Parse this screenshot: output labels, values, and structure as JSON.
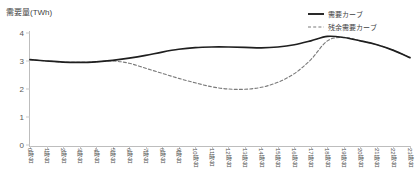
{
  "chart_data": {
    "type": "line",
    "title": "",
    "ylabel": "需要量(TWh)",
    "xlabel": "",
    "ylim": [
      0,
      4
    ],
    "yticks": [
      0,
      1,
      2,
      3,
      4
    ],
    "ytick_labels": [
      "0",
      "1",
      "2",
      "3",
      "4"
    ],
    "grid": false,
    "legend_position": "top-right",
    "categories": [
      "0時台",
      "1時台",
      "2時台",
      "3時台",
      "4時台",
      "5時台",
      "6時台",
      "7時台",
      "8時台",
      "9時台",
      "10時台",
      "11時台",
      "12時台",
      "13時台",
      "14時台",
      "15時台",
      "16時台",
      "17時台",
      "18時台",
      "19時台",
      "20時台",
      "21時台",
      "22時台",
      "23時台"
    ],
    "series": [
      {
        "name": "需要カーブ",
        "style": "solid",
        "color": "#1f1f1f",
        "values": [
          3.05,
          3.0,
          2.96,
          2.95,
          2.97,
          3.02,
          3.1,
          3.2,
          3.32,
          3.42,
          3.48,
          3.5,
          3.5,
          3.49,
          3.47,
          3.5,
          3.58,
          3.72,
          3.88,
          3.84,
          3.72,
          3.58,
          3.38,
          3.12
        ]
      },
      {
        "name": "残余需要カーブ",
        "style": "dashed",
        "color": "#7a7a7a",
        "values": [
          3.05,
          3.0,
          2.96,
          2.95,
          2.97,
          3.0,
          2.92,
          2.74,
          2.56,
          2.38,
          2.22,
          2.08,
          2.0,
          1.99,
          2.06,
          2.24,
          2.55,
          3.05,
          3.72,
          3.84,
          3.72,
          3.58,
          3.38,
          3.12
        ]
      }
    ]
  },
  "legend": {
    "items": [
      {
        "label": "需要カーブ",
        "style": "solid",
        "color": "#1f1f1f"
      },
      {
        "label": "残余需要カーブ",
        "style": "dashed",
        "color": "#7a7a7a"
      }
    ]
  }
}
